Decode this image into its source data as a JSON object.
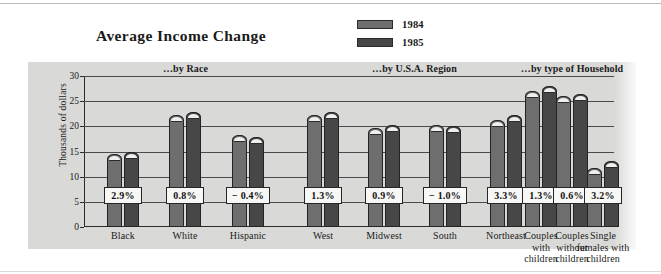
{
  "chart_data": {
    "type": "bar",
    "title": "Average Income Change",
    "xlabel": "",
    "ylabel": "Thousands of dollars",
    "ylim": [
      0,
      30
    ],
    "yticks": [
      0,
      5,
      10,
      15,
      20,
      25,
      30
    ],
    "grid": true,
    "legend_position": "top-right",
    "legend": [
      "1984",
      "1985"
    ],
    "categories": [
      "Black",
      "White",
      "Hispanic",
      "West",
      "Midwest",
      "South",
      "Northeast",
      "Couples\nwith\nchildren",
      "Couples\nwithout\nchildren",
      "Single\nfemales with\nchildren"
    ],
    "series": [
      {
        "name": "1984",
        "color": "#6e6e6e",
        "values": [
          14.5,
          22.2,
          18.2,
          22.2,
          19.6,
          20.2,
          21.2,
          27.0,
          26.0,
          11.8
        ]
      },
      {
        "name": "1985",
        "color": "#474747",
        "values": [
          15.0,
          22.8,
          17.8,
          22.8,
          20.2,
          20.0,
          22.2,
          28.0,
          26.5,
          13.2
        ]
      }
    ],
    "annotations": [
      "2.9%",
      "0.8%",
      "− 0.4%",
      "1.3%",
      "0.9%",
      "− 1.0%",
      "3.3%",
      "1.3%",
      "0.6%",
      "3.2%"
    ],
    "sections": [
      {
        "caption": "…by Race",
        "members": [
          "Black",
          "White",
          "Hispanic"
        ]
      },
      {
        "caption": "…by U.S.A. Region",
        "members": [
          "West",
          "Midwest",
          "South",
          "Northeast"
        ]
      },
      {
        "caption": "…by type of Household",
        "members": [
          "Couples with children",
          "Couples without children",
          "Single females with children"
        ]
      }
    ]
  },
  "header": {
    "title": "Average Income Change"
  },
  "legend": {
    "items": [
      {
        "label": "1984",
        "color": "#6e6e6e"
      },
      {
        "label": "1985",
        "color": "#474747"
      }
    ]
  },
  "axes": {
    "y_title": "Thousands of dollars",
    "y_ticks": [
      "0",
      "5",
      "10",
      "15",
      "20",
      "25",
      "30"
    ]
  },
  "sections": [
    {
      "caption": "…by Race"
    },
    {
      "caption": "…by U.S.A. Region"
    },
    {
      "caption": "…by type of Household"
    }
  ],
  "colors": {
    "panel_background": "#d9d9d7",
    "bar_1984": "#6e6e6e",
    "bar_1985": "#474747",
    "gridline": "#4a4a4a",
    "text": "#1b1b1b"
  }
}
